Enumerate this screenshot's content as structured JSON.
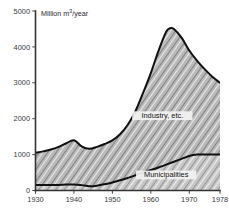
{
  "chart_data": {
    "type": "area",
    "title": "",
    "subtitle": "",
    "xlabel": "",
    "ylabel": "Million m³/year",
    "ylabel_display": "Million m",
    "ylabel_sup": "3",
    "ylabel_tail": "/year",
    "xlim": [
      1930,
      1978
    ],
    "ylim": [
      0,
      5000
    ],
    "grid": false,
    "legend_position": "inside-annotations",
    "y_ticks": [
      0,
      1000,
      2000,
      3000,
      4000,
      5000
    ],
    "y_tick_labels": [
      "0",
      "1000",
      "2000",
      "3000",
      "4000",
      "5000"
    ],
    "x_ticks": [
      1930,
      1940,
      1950,
      1960,
      1970,
      1978
    ],
    "x_tick_labels": [
      "1930",
      "1940",
      "1950",
      "1960",
      "1970",
      "1978"
    ],
    "stacked": true,
    "x": [
      1930,
      1932,
      1934,
      1936,
      1938,
      1940,
      1942,
      1944,
      1946,
      1948,
      1950,
      1952,
      1954,
      1956,
      1958,
      1960,
      1962,
      1964,
      1965,
      1966,
      1968,
      1970,
      1972,
      1974,
      1976,
      1978
    ],
    "series": [
      {
        "name": "Municipalities",
        "label": "Municipalities",
        "fill": "hatch-municipalities",
        "values": [
          150,
          150,
          150,
          155,
          165,
          170,
          150,
          120,
          135,
          175,
          225,
          285,
          350,
          420,
          500,
          570,
          640,
          720,
          760,
          800,
          880,
          960,
          1000,
          1000,
          1000,
          1000
        ]
      },
      {
        "name": "Industry, etc.",
        "label": "Industry, etc.",
        "fill": "hatch-industry",
        "values": [
          900,
          940,
          990,
          1060,
          1150,
          1230,
          1080,
          1040,
          1080,
          1120,
          1170,
          1280,
          1480,
          1790,
          2220,
          2700,
          3250,
          3700,
          3760,
          3700,
          3380,
          2940,
          2620,
          2380,
          2170,
          2000
        ]
      }
    ],
    "totals": [
      1050,
      1090,
      1140,
      1215,
      1315,
      1400,
      1230,
      1160,
      1215,
      1295,
      1395,
      1565,
      1830,
      2210,
      2720,
      3270,
      3890,
      4420,
      4520,
      4500,
      4260,
      3900,
      3620,
      3380,
      3170,
      3000
    ],
    "annotations": [
      {
        "text": "Industry, etc.",
        "x": 1963,
        "y": 2050
      },
      {
        "text": "Municipalities",
        "x": 1964,
        "y": 400
      }
    ],
    "colors": {
      "line": "#101010",
      "axis": "#333333",
      "text": "#2b2b2b",
      "fill_upper": "#b4b4b4",
      "fill_lower": "#c9c9c9",
      "background": "#ffffff"
    }
  }
}
